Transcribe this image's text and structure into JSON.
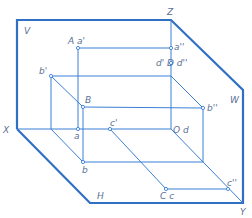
{
  "diagram": {
    "planes": {
      "V": "V",
      "H": "H",
      "W": "W"
    },
    "axes": {
      "X": "X",
      "Y": "Y",
      "Z": "Z"
    },
    "labels": {
      "A_a1": "A a'",
      "a2": "a''",
      "d1_D_d2": "d' D d''",
      "b1": "b'",
      "B": "B",
      "b2": "b''",
      "a": "a",
      "c1": "c'",
      "O_d": "O d",
      "b": "b",
      "C_c": "C c",
      "c2": "c''"
    },
    "colors": {
      "frame": "#2f6fc4",
      "lines": "#3b7fd6",
      "text": "#5a6f96",
      "background": "#ffffff"
    }
  }
}
